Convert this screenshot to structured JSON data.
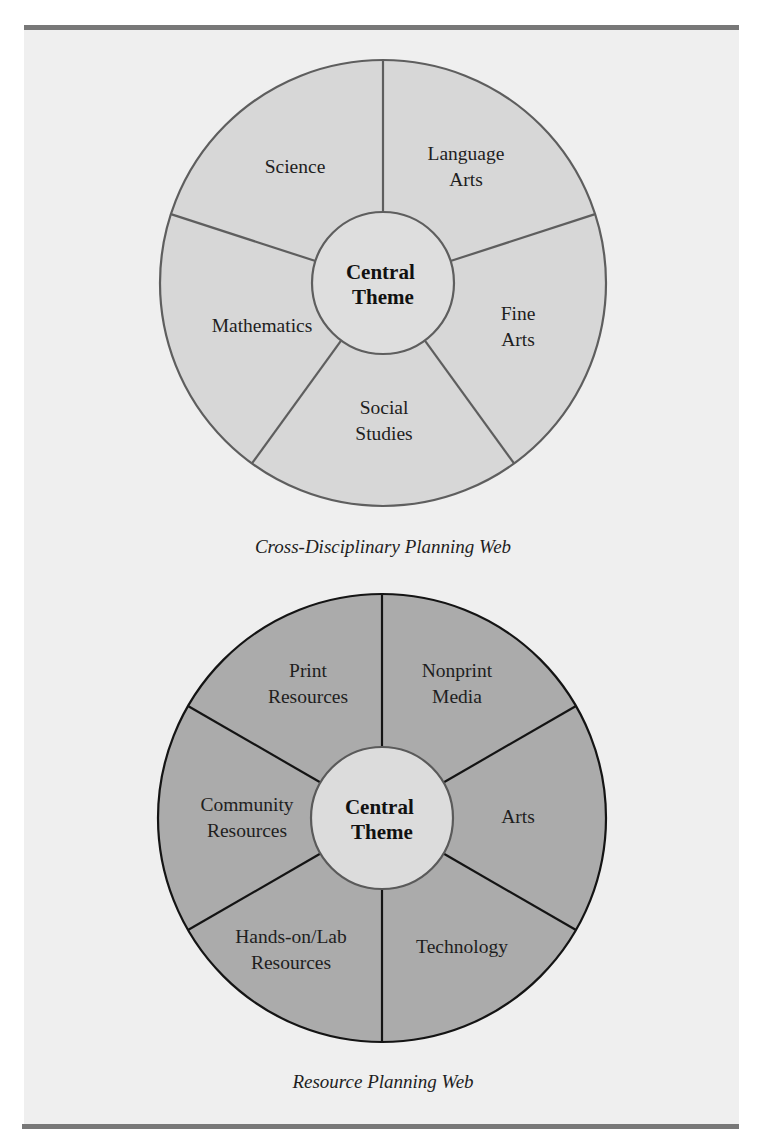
{
  "figure": {
    "colors": {
      "page_background": "#ffffff",
      "panel_background": "#efefef",
      "rule": "#787878"
    },
    "webs": [
      {
        "caption": "Cross-Disciplinary Planning Web",
        "center_label": [
          "Central",
          "Theme"
        ],
        "colors": {
          "ring_fill": "#d7d7d7",
          "hub_fill": "#dedede",
          "stroke": "#5e5e5e",
          "hub_stroke": "#5e5e5e"
        },
        "geometry": {
          "cx": 383,
          "cy": 283,
          "r": 223,
          "hub_r": 71,
          "spoke_angles": [
            -90,
            -18,
            54,
            126,
            198
          ]
        },
        "segments": [
          {
            "lines": [
              "Science"
            ],
            "x": 295,
            "y": 173
          },
          {
            "lines": [
              "Language",
              "Arts"
            ],
            "x": 466,
            "y": 160
          },
          {
            "lines": [
              "Fine",
              "Arts"
            ],
            "x": 518,
            "y": 320
          },
          {
            "lines": [
              "Social",
              "Studies"
            ],
            "x": 384,
            "y": 414
          },
          {
            "lines": [
              "Mathematics"
            ],
            "x": 262,
            "y": 332
          }
        ]
      },
      {
        "caption": "Resource Planning Web",
        "center_label": [
          "Central",
          "Theme"
        ],
        "colors": {
          "ring_fill": "#ababab",
          "hub_fill": "#dcdcdc",
          "stroke": "#141414",
          "hub_stroke": "#5a5a5a"
        },
        "geometry": {
          "cx": 382,
          "cy": 818,
          "r": 224,
          "hub_r": 71,
          "spoke_angles": [
            -90,
            -30,
            30,
            90,
            150,
            210
          ]
        },
        "segments": [
          {
            "lines": [
              "Nonprint",
              "Media"
            ],
            "x": 457,
            "y": 677
          },
          {
            "lines": [
              "Arts"
            ],
            "x": 518,
            "y": 823
          },
          {
            "lines": [
              "Technology"
            ],
            "x": 462,
            "y": 953
          },
          {
            "lines": [
              "Hands-on/Lab",
              "Resources"
            ],
            "x": 291,
            "y": 943
          },
          {
            "lines": [
              "Community",
              "Resources"
            ],
            "x": 247,
            "y": 811
          },
          {
            "lines": [
              "Print",
              "Resources"
            ],
            "x": 308,
            "y": 677
          }
        ]
      }
    ],
    "caption_positions": [
      {
        "x": 383,
        "y": 553
      },
      {
        "x": 383,
        "y": 1088
      }
    ]
  }
}
